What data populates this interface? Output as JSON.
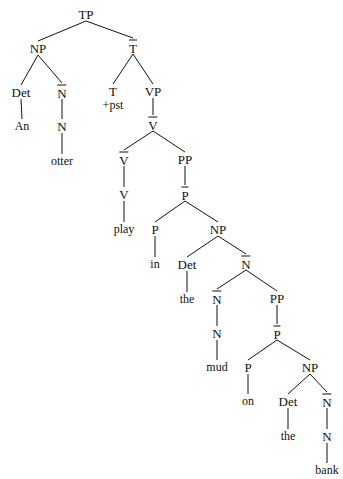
{
  "diagram": {
    "sentence": "An otter play +pst in the mud on the bank",
    "width": 343,
    "height": 479,
    "line_color": "#111111",
    "text_color": "#111111",
    "background": "#ffffff",
    "nodes": [
      {
        "id": "TP",
        "label": "TP",
        "overbar": false,
        "kind": "phrase",
        "x": 86,
        "y": 14
      },
      {
        "id": "NP1",
        "label": "NP",
        "overbar": false,
        "kind": "phrase",
        "x": 38,
        "y": 48
      },
      {
        "id": "Tbar",
        "label": "T",
        "overbar": true,
        "kind": "bar",
        "x": 133,
        "y": 47
      },
      {
        "id": "Det1",
        "label": "Det",
        "overbar": false,
        "kind": "head",
        "x": 21,
        "y": 92
      },
      {
        "id": "Nbar1",
        "label": "N",
        "overbar": true,
        "kind": "bar",
        "x": 62,
        "y": 92
      },
      {
        "id": "T",
        "label": "T",
        "overbar": false,
        "kind": "head",
        "x": 113,
        "y": 91
      },
      {
        "id": "Tfeat",
        "label": "+pst",
        "overbar": false,
        "kind": "feature",
        "x": 113,
        "y": 105
      },
      {
        "id": "VP",
        "label": "VP",
        "overbar": false,
        "kind": "phrase",
        "x": 153,
        "y": 91
      },
      {
        "id": "An",
        "label": "An",
        "overbar": false,
        "kind": "leaf",
        "x": 22,
        "y": 126
      },
      {
        "id": "N1",
        "label": "N",
        "overbar": false,
        "kind": "head",
        "x": 62,
        "y": 126
      },
      {
        "id": "Vbar1",
        "label": "V",
        "overbar": true,
        "kind": "bar",
        "x": 153,
        "y": 124
      },
      {
        "id": "otter",
        "label": "otter",
        "overbar": false,
        "kind": "leaf",
        "x": 62,
        "y": 161
      },
      {
        "id": "Vbar2",
        "label": "V",
        "overbar": true,
        "kind": "bar",
        "x": 124,
        "y": 159
      },
      {
        "id": "PP1",
        "label": "PP",
        "overbar": false,
        "kind": "phrase",
        "x": 185,
        "y": 159
      },
      {
        "id": "V",
        "label": "V",
        "overbar": false,
        "kind": "head",
        "x": 124,
        "y": 194
      },
      {
        "id": "Pbar1",
        "label": "P",
        "overbar": true,
        "kind": "bar",
        "x": 185,
        "y": 194
      },
      {
        "id": "play",
        "label": "play",
        "overbar": false,
        "kind": "leaf",
        "x": 124,
        "y": 229
      },
      {
        "id": "P1",
        "label": "P",
        "overbar": false,
        "kind": "head",
        "x": 155,
        "y": 229
      },
      {
        "id": "NP2",
        "label": "NP",
        "overbar": false,
        "kind": "phrase",
        "x": 218,
        "y": 229
      },
      {
        "id": "in",
        "label": "in",
        "overbar": false,
        "kind": "leaf",
        "x": 155,
        "y": 264
      },
      {
        "id": "Det2",
        "label": "Det",
        "overbar": false,
        "kind": "head",
        "x": 187,
        "y": 264
      },
      {
        "id": "Nbar2",
        "label": "N",
        "overbar": true,
        "kind": "bar",
        "x": 246,
        "y": 263
      },
      {
        "id": "the1",
        "label": "the",
        "overbar": false,
        "kind": "leaf",
        "x": 187,
        "y": 299
      },
      {
        "id": "Nbar3",
        "label": "N",
        "overbar": true,
        "kind": "bar",
        "x": 217,
        "y": 298
      },
      {
        "id": "PP2",
        "label": "PP",
        "overbar": false,
        "kind": "phrase",
        "x": 277,
        "y": 298
      },
      {
        "id": "N2",
        "label": "N",
        "overbar": false,
        "kind": "head",
        "x": 217,
        "y": 333
      },
      {
        "id": "Pbar2",
        "label": "P",
        "overbar": true,
        "kind": "bar",
        "x": 277,
        "y": 333
      },
      {
        "id": "mud",
        "label": "mud",
        "overbar": false,
        "kind": "leaf",
        "x": 217,
        "y": 367
      },
      {
        "id": "P2",
        "label": "P",
        "overbar": false,
        "kind": "head",
        "x": 248,
        "y": 367
      },
      {
        "id": "NP3",
        "label": "NP",
        "overbar": false,
        "kind": "phrase",
        "x": 310,
        "y": 367
      },
      {
        "id": "on",
        "label": "on",
        "overbar": false,
        "kind": "leaf",
        "x": 248,
        "y": 401
      },
      {
        "id": "Det3",
        "label": "Det",
        "overbar": false,
        "kind": "head",
        "x": 288,
        "y": 401
      },
      {
        "id": "Nbar4",
        "label": "N",
        "overbar": true,
        "kind": "bar",
        "x": 327,
        "y": 401
      },
      {
        "id": "the2",
        "label": "the",
        "overbar": false,
        "kind": "leaf",
        "x": 288,
        "y": 436
      },
      {
        "id": "N3",
        "label": "N",
        "overbar": false,
        "kind": "head",
        "x": 327,
        "y": 436
      },
      {
        "id": "bank",
        "label": "bank",
        "overbar": false,
        "kind": "leaf",
        "x": 327,
        "y": 470
      }
    ],
    "edges": [
      {
        "from": "TP",
        "to": "NP1"
      },
      {
        "from": "TP",
        "to": "Tbar"
      },
      {
        "from": "NP1",
        "to": "Det1"
      },
      {
        "from": "NP1",
        "to": "Nbar1"
      },
      {
        "from": "Tbar",
        "to": "T"
      },
      {
        "from": "Tbar",
        "to": "VP"
      },
      {
        "from": "Det1",
        "to": "An"
      },
      {
        "from": "Nbar1",
        "to": "N1"
      },
      {
        "from": "VP",
        "to": "Vbar1"
      },
      {
        "from": "N1",
        "to": "otter"
      },
      {
        "from": "Vbar1",
        "to": "Vbar2"
      },
      {
        "from": "Vbar1",
        "to": "PP1"
      },
      {
        "from": "Vbar2",
        "to": "V"
      },
      {
        "from": "PP1",
        "to": "Pbar1"
      },
      {
        "from": "V",
        "to": "play"
      },
      {
        "from": "Pbar1",
        "to": "P1"
      },
      {
        "from": "Pbar1",
        "to": "NP2"
      },
      {
        "from": "P1",
        "to": "in"
      },
      {
        "from": "NP2",
        "to": "Det2"
      },
      {
        "from": "NP2",
        "to": "Nbar2"
      },
      {
        "from": "Det2",
        "to": "the1"
      },
      {
        "from": "Nbar2",
        "to": "Nbar3"
      },
      {
        "from": "Nbar2",
        "to": "PP2"
      },
      {
        "from": "Nbar3",
        "to": "N2"
      },
      {
        "from": "PP2",
        "to": "Pbar2"
      },
      {
        "from": "N2",
        "to": "mud"
      },
      {
        "from": "Pbar2",
        "to": "P2"
      },
      {
        "from": "Pbar2",
        "to": "NP3"
      },
      {
        "from": "P2",
        "to": "on"
      },
      {
        "from": "NP3",
        "to": "Det3"
      },
      {
        "from": "NP3",
        "to": "Nbar4"
      },
      {
        "from": "Det3",
        "to": "the2"
      },
      {
        "from": "Nbar4",
        "to": "N3"
      },
      {
        "from": "N3",
        "to": "bank"
      }
    ]
  }
}
